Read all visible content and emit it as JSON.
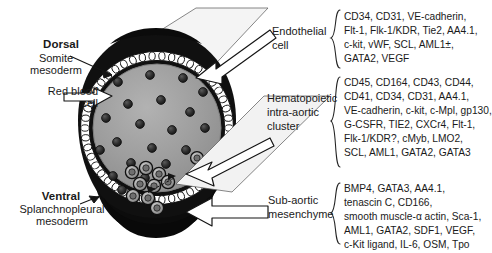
{
  "figure": {
    "type": "schematic-cross-section"
  },
  "anatomy_labels": {
    "dorsal": "Dorsal",
    "somite_mesoderm": "Somite\nmesoderm",
    "red_blood_cell": "Red blood\ncell",
    "ventral": "Ventral",
    "splanchnopleural_mesoderm": "Splanchnopleural\nmesoderm"
  },
  "callouts": [
    {
      "id": "endothelial",
      "label": "Endothelial\ncell",
      "markers": "CD34, CD31, VE-cadherin,\nFlt-1, Flk-1/KDR, Tie2, AA4.1,\nc-kit, vWF, SCL, AML1±,\nGATA2, VEGF",
      "marker_list": [
        "CD34",
        "CD31",
        "VE-cadherin",
        "Flt-1",
        "Flk-1/KDR",
        "Tie2",
        "AA4.1",
        "c-kit",
        "vWF",
        "SCL",
        "AML1±",
        "GATA2",
        "VEGF"
      ]
    },
    {
      "id": "hematopoietic",
      "label": "Hematopoietic\nintra-aortic\ncluster",
      "markers": "CD45, CD164, CD43, CD44,\nCD41, CD34, CD31, AA4.1,\nVE-cadherin, c-kit, c-Mpl, gp130,\nG-CSFR, TIE2, CXCr4, Flt-1,\nFlk-1/KDR?, cMyb, LMO2,\nSCL, AML1, GATA2, GATA3",
      "marker_list": [
        "CD45",
        "CD164",
        "CD43",
        "CD44",
        "CD41",
        "CD34",
        "CD31",
        "AA4.1",
        "VE-cadherin",
        "c-kit",
        "c-Mpl",
        "gp130",
        "G-CSFR",
        "TIE2",
        "CXCr4",
        "Flt-1",
        "Flk-1/KDR?",
        "cMyb",
        "LMO2",
        "SCL",
        "AML1",
        "GATA2",
        "GATA3"
      ]
    },
    {
      "id": "subaortic",
      "label": "Sub-aortic\nmesenchyme",
      "markers": "BMP4, GATA3, AA4.1,\ntenascin C, CD166,\nsmooth muscle-α actin, Sca-1,\nAML1, GATA2, SDF1, VEGF,\nc-Kit ligand, IL-6, OSM, Tpo",
      "marker_list": [
        "BMP4",
        "GATA3",
        "AA4.1",
        "tenascin C",
        "CD166",
        "smooth muscle-α actin",
        "Sca-1",
        "AML1",
        "GATA2",
        "SDF1",
        "VEGF",
        "c-Kit ligand",
        "IL-6",
        "OSM",
        "Tpo"
      ]
    }
  ],
  "colors": {
    "lumen": "#9e9e9e",
    "lumen_edge": "#8a8a8a",
    "mesenchyme_dark": "#121212",
    "endothelium": "#ffffff",
    "rbc": "#2b2b2b",
    "cluster_cell": "#8f8f8f",
    "outline": "#111111",
    "arrow_fill": "#ffffff",
    "arrow_shaft": "#e9e9e9",
    "text": "#1a1a1a"
  },
  "counts": {
    "red_blood_cells": 22,
    "cluster_cells": 9,
    "endothelial_cells_ring": 46
  }
}
